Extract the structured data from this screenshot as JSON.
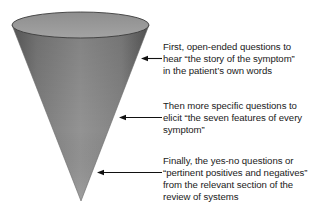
{
  "diagram": {
    "type": "funnel-cone",
    "cone": {
      "fill_color": "#8c8c8c",
      "rim_color": "#9a9a9a",
      "edge_color": "#555555",
      "shape_name": "inverted-cone"
    },
    "annotations": [
      {
        "id": "stage-1",
        "text": "First, open-ended questions to\nhear “the story of the symptom”\nin the patient’s own words",
        "arrow_direction": "left"
      },
      {
        "id": "stage-2",
        "text": "Then more specific questions to\nelicit “the seven features of every\nsymptom”",
        "arrow_direction": "left"
      },
      {
        "id": "stage-3",
        "text": "Finally, the yes-no questions or\n“pertinent positives and negatives”\nfrom the relevant section of the\nreview of systems",
        "arrow_direction": "left"
      }
    ]
  }
}
